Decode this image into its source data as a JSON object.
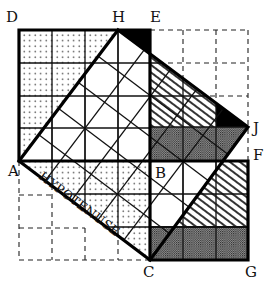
{
  "figure": {
    "unit_px": 33,
    "labels": [
      {
        "id": "D",
        "text": "D"
      },
      {
        "id": "H",
        "text": "H"
      },
      {
        "id": "E",
        "text": "E"
      },
      {
        "id": "J",
        "text": "J"
      },
      {
        "id": "F",
        "text": "F"
      },
      {
        "id": "A",
        "text": "A"
      },
      {
        "id": "B",
        "text": "B"
      },
      {
        "id": "C",
        "text": "C"
      },
      {
        "id": "G",
        "text": "G"
      }
    ],
    "hypotenuse_label": "HYPOTENUSE",
    "squares": [
      {
        "name": "square-on-AB",
        "vertices": [
          "A",
          "D",
          "E",
          "B"
        ],
        "side_units": 4
      },
      {
        "name": "square-on-BC",
        "vertices": [
          "B",
          "F",
          "G",
          "C"
        ],
        "side_units": 3
      },
      {
        "name": "square-on-AC",
        "vertices": [
          "A",
          "H",
          "J",
          "C"
        ],
        "side_units": 5
      }
    ],
    "fills": {
      "dotted": "#000000",
      "hatched": "#000000",
      "crosshatched": "#000000",
      "solid": "#000000"
    }
  }
}
